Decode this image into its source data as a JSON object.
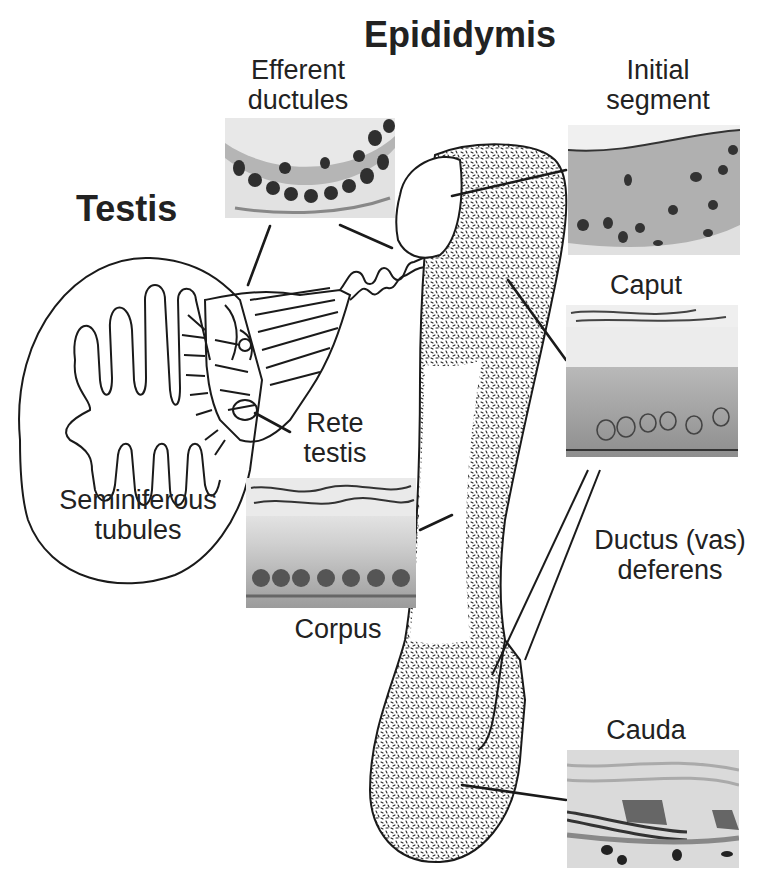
{
  "titles": {
    "epididymis": "Epididymis",
    "testis": "Testis"
  },
  "labels": {
    "efferent_ductules": [
      "Efferent",
      "ductules"
    ],
    "initial_segment": [
      "Initial",
      "segment"
    ],
    "caput": "Caput",
    "rete_testis": [
      "Rete",
      "testis"
    ],
    "seminiferous_tubules": [
      "Seminiferous",
      "tubules"
    ],
    "corpus": "Corpus",
    "ductus_deferens": [
      "Ductus (vas)",
      "deferens"
    ],
    "cauda": "Cauda"
  },
  "micrographs": [
    {
      "id": "efferent-ductules",
      "label": "Efferent ductules"
    },
    {
      "id": "initial-segment",
      "label": "Initial segment"
    },
    {
      "id": "caput",
      "label": "Caput"
    },
    {
      "id": "corpus",
      "label": "Corpus"
    },
    {
      "id": "cauda",
      "label": "Cauda"
    }
  ],
  "colors": {
    "ink": "#1a1a1a",
    "background": "#ffffff",
    "tissue_light": "#d9d9d9",
    "tissue_mid": "#a8a8a8",
    "nucleus": "#3a3a3a"
  }
}
